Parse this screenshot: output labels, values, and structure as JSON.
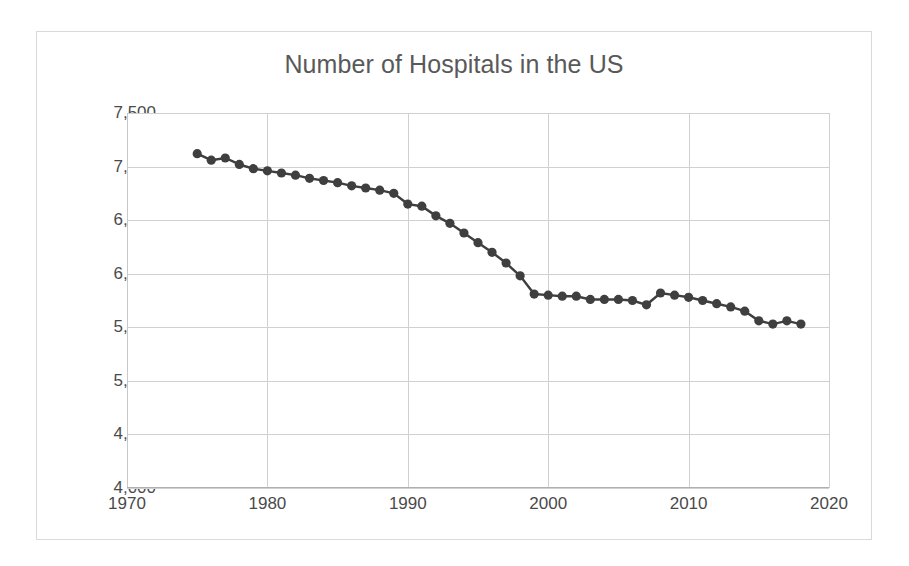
{
  "chart_data": {
    "type": "line",
    "title": "Number of Hospitals in the US",
    "xlabel": "",
    "ylabel": "",
    "xlim": [
      1970,
      2020
    ],
    "ylim": [
      4000,
      7500
    ],
    "grid": true,
    "legend": false,
    "marker": "circle",
    "series_color": "#3f3f3f",
    "x_ticks": [
      1970,
      1980,
      1990,
      2000,
      2010,
      2020
    ],
    "x_tick_labels": [
      "1970",
      "1980",
      "1990",
      "2000",
      "2010",
      "2020"
    ],
    "y_ticks": [
      4000,
      4500,
      5000,
      5500,
      6000,
      6500,
      7000,
      7500
    ],
    "y_tick_labels": [
      "4,000",
      "4,500",
      "5,000",
      "5,500",
      "6,000",
      "6,500",
      "7,000",
      "7,500"
    ],
    "x": [
      1975,
      1976,
      1977,
      1978,
      1979,
      1980,
      1981,
      1982,
      1983,
      1984,
      1985,
      1986,
      1987,
      1988,
      1989,
      1990,
      1991,
      1992,
      1993,
      1994,
      1995,
      1996,
      1997,
      1998,
      1999,
      2000,
      2001,
      2002,
      2003,
      2004,
      2005,
      2006,
      2007,
      2008,
      2009,
      2010,
      2011,
      2012,
      2013,
      2014,
      2015,
      2016,
      2017,
      2018
    ],
    "values": [
      7120,
      7060,
      7080,
      7020,
      6980,
      6960,
      6940,
      6920,
      6890,
      6870,
      6850,
      6820,
      6800,
      6780,
      6750,
      6650,
      6630,
      6540,
      6470,
      6380,
      6290,
      6200,
      6100,
      5980,
      5810,
      5800,
      5790,
      5790,
      5760,
      5760,
      5760,
      5750,
      5710,
      5820,
      5800,
      5780,
      5750,
      5720,
      5690,
      5650,
      5560,
      5530,
      5560,
      5530
    ],
    "series": [
      {
        "name": "Number of Hospitals",
        "values": [
          7120,
          7060,
          7080,
          7020,
          6980,
          6960,
          6940,
          6920,
          6890,
          6870,
          6850,
          6820,
          6800,
          6780,
          6750,
          6650,
          6630,
          6540,
          6470,
          6380,
          6290,
          6200,
          6100,
          5980,
          5810,
          5800,
          5790,
          5790,
          5760,
          5760,
          5760,
          5750,
          5710,
          5820,
          5800,
          5780,
          5750,
          5720,
          5690,
          5650,
          5560,
          5530,
          5560,
          5530
        ]
      }
    ]
  }
}
